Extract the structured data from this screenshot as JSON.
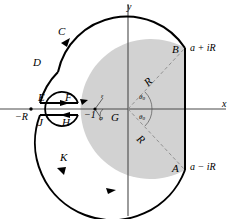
{
  "figure": {
    "colors": {
      "shaded_region": "#d2d2d2",
      "contour_stroke": "#000000",
      "axis_stroke": "#555555",
      "dashed_stroke": "#777777",
      "background": "#ffffff"
    },
    "axes": {
      "x_label": "x",
      "y_label": "y"
    },
    "contour_points": [
      {
        "name": "A",
        "label": "A"
      },
      {
        "name": "B",
        "label": "B"
      },
      {
        "name": "C",
        "label": "C"
      },
      {
        "name": "D",
        "label": "D"
      },
      {
        "name": "E",
        "label": "E"
      },
      {
        "name": "F",
        "label": "F"
      },
      {
        "name": "G",
        "label": "G"
      },
      {
        "name": "H",
        "label": "H"
      },
      {
        "name": "J",
        "label": "J"
      },
      {
        "name": "K",
        "label": "K"
      }
    ],
    "value_labels": [
      {
        "name": "b-endpoint-value",
        "label": "a + iR"
      },
      {
        "name": "a-endpoint-value",
        "label": "a − iR"
      },
      {
        "name": "negative-r-value",
        "label": "−R"
      },
      {
        "name": "branch-point-value",
        "label": "−1"
      }
    ],
    "radius_labels": [
      {
        "name": "radius-upper",
        "label": "R"
      },
      {
        "name": "radius-lower",
        "label": "R"
      }
    ],
    "angle_labels": [
      {
        "name": "theta-upper",
        "symbol": "θ",
        "subscript": "0"
      },
      {
        "name": "theta-lower",
        "symbol": "θ",
        "subscript": "0"
      }
    ],
    "small_circle_labels": [
      {
        "name": "epsilon-radius",
        "label": "ε"
      },
      {
        "name": "phi-angle",
        "label": "φ"
      }
    ]
  }
}
